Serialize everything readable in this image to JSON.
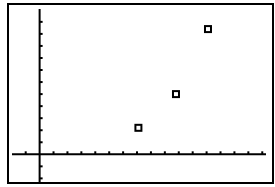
{
  "chart_data": {
    "type": "scatter",
    "title": "",
    "xlabel": "",
    "ylabel": "",
    "marker": "open-square",
    "grid": false,
    "legend": null,
    "window": {
      "xmin": -2.2,
      "xmax": 16.7,
      "xscl": 1,
      "ymin": -2.3,
      "ymax": 12.4,
      "yscl": 1
    },
    "series": [
      {
        "name": "points",
        "points": [
          {
            "x": 7.1,
            "y": 2.2
          },
          {
            "x": 9.8,
            "y": 5.0
          },
          {
            "x": 12.1,
            "y": 10.4
          }
        ]
      }
    ]
  },
  "colors": {
    "foreground": "#000000",
    "background": "#ffffff"
  }
}
